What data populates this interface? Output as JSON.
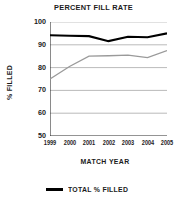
{
  "chart_data": {
    "type": "line",
    "title": "PERCENT FILL RATE",
    "xlabel": "MATCH YEAR",
    "ylabel": "% FILLED",
    "categories": [
      "1999",
      "2000",
      "2001",
      "2002",
      "2003",
      "2004",
      "2005"
    ],
    "x_tick_labels": [
      "1999",
      "2000",
      "2001",
      "2002",
      "2003",
      "2004",
      "2005"
    ],
    "y_tick_labels": [
      "100",
      "90",
      "80",
      "70",
      "60",
      "50"
    ],
    "y_ticks": [
      100,
      90,
      80,
      70,
      60,
      50
    ],
    "ylim": [
      50,
      100
    ],
    "grid": "horizontal",
    "legend_position": "bottom-left",
    "series": [
      {
        "name": "TOTAL % FILLED",
        "color": "#000000",
        "values": [
          94.2,
          94.0,
          93.8,
          91.6,
          93.5,
          93.3,
          95.0
        ]
      },
      {
        "name": "",
        "color": "#9a9a9a",
        "values": [
          75.0,
          80.5,
          85.0,
          85.2,
          85.5,
          84.4,
          87.5
        ]
      }
    ]
  },
  "legend": {
    "items": [
      {
        "label": "TOTAL % FILLED",
        "color": "#000000"
      }
    ]
  }
}
